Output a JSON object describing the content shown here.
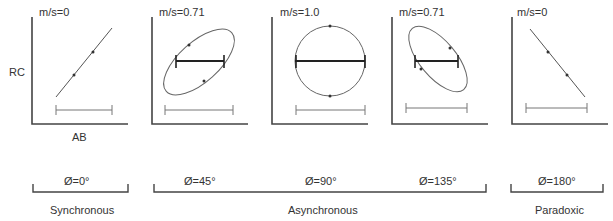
{
  "axes": {
    "y_label": "RC",
    "x_label": "AB"
  },
  "panels": [
    {
      "ratio_label": "m/s=0",
      "shape": "line-positive",
      "phase": "Ø=0°"
    },
    {
      "ratio_label": "m/s=0.71",
      "shape": "ellipse-positive",
      "phase": "Ø=45°"
    },
    {
      "ratio_label": "m/s=1.0",
      "shape": "circle",
      "phase": "Ø=90°"
    },
    {
      "ratio_label": "m/s=0.71",
      "shape": "ellipse-negative",
      "phase": "Ø=135°"
    },
    {
      "ratio_label": "m/s=0",
      "shape": "line-negative",
      "phase": "Ø=180°"
    }
  ],
  "groups": [
    {
      "label": "Synchronous"
    },
    {
      "label": "Asynchronous"
    },
    {
      "label": "Paradoxic"
    }
  ],
  "colors": {
    "stroke": "#444444",
    "thin": "#666666",
    "text": "#333333"
  }
}
